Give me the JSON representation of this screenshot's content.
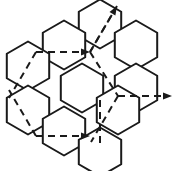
{
  "figure": {
    "type": "diagram",
    "background_color": "#ffffff",
    "line_color": "#1a1a1a",
    "cell_fill": "#ffffff",
    "solid_stroke_width": 2,
    "dashed_stroke_width": 2,
    "dash_pattern": "7 5",
    "canvas": {
      "width": 178,
      "height": 171
    }
  },
  "lattice": {
    "cell_shape": "hexagon",
    "orientation": "pointy-side-horizontal",
    "hex_radius": 24.5,
    "hex_half_width": 21.2,
    "cell_count": 10,
    "cells": [
      {
        "id": "hex-top-center",
        "label": "top center",
        "cx": 100,
        "cy": 24
      },
      {
        "id": "hex-upper-left",
        "label": "upper left",
        "cx": 64,
        "cy": 45
      },
      {
        "id": "hex-upper-right",
        "label": "upper right",
        "cx": 136,
        "cy": 45
      },
      {
        "id": "hex-mid-far-left",
        "label": "middle far left",
        "cx": 28,
        "cy": 66
      },
      {
        "id": "hex-center",
        "label": "center",
        "cx": 82,
        "cy": 88
      },
      {
        "id": "hex-mid-right",
        "label": "middle right",
        "cx": 136,
        "cy": 88
      },
      {
        "id": "hex-lower-left",
        "label": "lower left",
        "cx": 28,
        "cy": 110
      },
      {
        "id": "hex-lower-mid-left",
        "label": "lower mid left",
        "cx": 64,
        "cy": 131
      },
      {
        "id": "hex-lower-mid-right",
        "label": "lower mid right",
        "cx": 118,
        "cy": 110
      },
      {
        "id": "hex-bottom-center",
        "label": "bottom center",
        "cx": 100,
        "cy": 152
      }
    ]
  },
  "vectors": [
    {
      "id": "vector-a1",
      "label": "a1",
      "style": "dashed",
      "arrowhead": true,
      "from": {
        "x": 36,
        "y": 52
      },
      "to": {
        "x": 90,
        "y": 52
      },
      "direction": "horizontal-right"
    },
    {
      "id": "vector-a2",
      "label": "a2",
      "style": "dashed",
      "arrowhead": true,
      "from": {
        "x": 36,
        "y": 136
      },
      "to": {
        "x": 90,
        "y": 136
      },
      "direction": "horizontal-right"
    },
    {
      "id": "vector-a3",
      "label": "a3",
      "style": "dashed",
      "arrowhead": true,
      "from": {
        "x": 118,
        "y": 96
      },
      "to": {
        "x": 172,
        "y": 96
      },
      "direction": "horizontal-right"
    },
    {
      "id": "vector-b1",
      "label": "b1",
      "style": "dashed",
      "arrowhead": true,
      "from": {
        "x": 90,
        "y": 52
      },
      "to": {
        "x": 117,
        "y": 6
      },
      "direction": "diagonal-up-right"
    },
    {
      "id": "vector-b2",
      "label": "b2",
      "style": "dashed",
      "arrowhead": false,
      "from": {
        "x": 36,
        "y": 136
      },
      "to": {
        "x": 9,
        "y": 90
      },
      "direction": "diagonal-up-left"
    },
    {
      "id": "vector-b3",
      "label": "b3",
      "style": "dashed",
      "arrowhead": false,
      "from": {
        "x": 36,
        "y": 52
      },
      "to": {
        "x": 9,
        "y": 98
      },
      "direction": "diagonal-down-left"
    },
    {
      "id": "vector-b4",
      "label": "b4",
      "style": "dashed",
      "arrowhead": false,
      "from": {
        "x": 90,
        "y": 52
      },
      "to": {
        "x": 118,
        "y": 96
      },
      "direction": "diagonal-down-right"
    },
    {
      "id": "vector-b5",
      "label": "b5",
      "style": "dashed",
      "arrowhead": false,
      "from": {
        "x": 117,
        "y": 6
      },
      "to": {
        "x": 90,
        "y": 52
      },
      "direction": "diagonal-down-left"
    },
    {
      "id": "vector-b6",
      "label": "b6",
      "style": "dashed",
      "arrowhead": false,
      "from": {
        "x": 118,
        "y": 96
      },
      "to": {
        "x": 91,
        "y": 142
      },
      "direction": "diagonal-down-left"
    },
    {
      "id": "vector-b7",
      "label": "b7",
      "style": "dashed",
      "arrowhead": false,
      "from": {
        "x": 100,
        "y": 100
      },
      "to": {
        "x": 100,
        "y": 148
      },
      "direction": "diagonal-down"
    }
  ]
}
